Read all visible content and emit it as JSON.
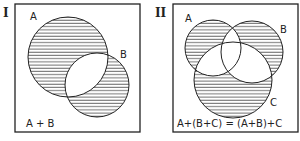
{
  "panels": [
    {
      "numeral": "I",
      "labels": {
        "a": "A",
        "b": "B"
      },
      "formula": "A + B"
    },
    {
      "numeral": "II",
      "labels": {
        "a": "A",
        "b": "B",
        "c": "C"
      },
      "formula": "A+(B+C) = (A+B)+C"
    }
  ],
  "colors": {
    "ink": "#222222",
    "paper": "#ffffff"
  }
}
